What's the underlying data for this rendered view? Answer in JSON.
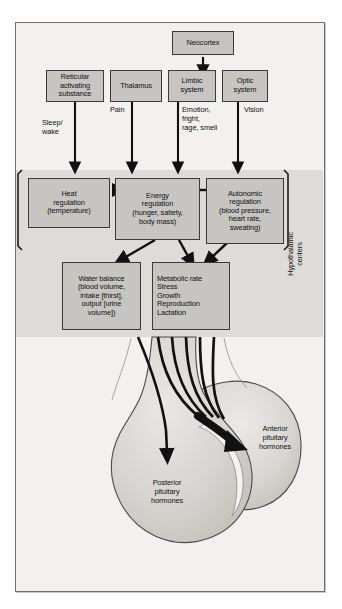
{
  "figure": {
    "colors": {
      "page_background": "#ffffff",
      "panel_background": "#f2f1ef",
      "shaded_band": "#dedcd8",
      "box_fill": "#c6c5c1",
      "box_border": "#3a3a3a",
      "frame_border": "#6e6e6e",
      "gland_fill": "#d5d3cf",
      "arrow": "#111111",
      "text": "#111111"
    }
  },
  "nodes": {
    "neocortex": {
      "label": "Neocortex"
    },
    "reticular": {
      "label": "Reticular\nactivating\nsubstance"
    },
    "thalamus": {
      "label": "Thalamus"
    },
    "limbic": {
      "label": "Limbic\nsystem"
    },
    "optic": {
      "label": "Optic\nsystem"
    },
    "heat": {
      "label": "Heat\nregulation\n(temperature)"
    },
    "energy": {
      "label": "Energy\nregulation\n(hunger, satiety,\nbody mass)"
    },
    "autonomic": {
      "label": "Autonomic\nregulation\n(blood pressure,\nheart rate,\nsweating)"
    },
    "water": {
      "label": "Water balance\n(blood volume,\nintake [thirst],\noutput [urine\nvolume])"
    },
    "metabolic": {
      "label": "Metabolic rate\nStress\nGrowth\nReproduction\nLactation"
    }
  },
  "pathway_labels": {
    "sleep_wake": "Sleep/\nwake",
    "pain": "Pain",
    "emotion": "Emotion,\nfright,\nrage, smell",
    "vision": "Vision"
  },
  "region_label": {
    "hypothalamic_centers": "Hypothalamic\ncenters"
  },
  "gland": {
    "posterior": "Posterior\npituitary\nhormones",
    "anterior": "Anterior\npituitary\nhormones"
  }
}
